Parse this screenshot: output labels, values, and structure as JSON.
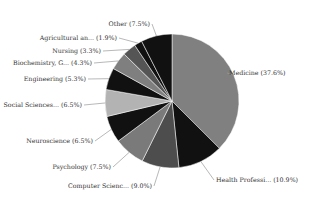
{
  "chart_data": {
    "type": "pie",
    "title": "",
    "start_angle_deg": 0,
    "direction": "clockwise",
    "legend": "none (labels on leader lines)",
    "categories": [
      "Medicine",
      "Health Professi...",
      "Computer Scienc...",
      "Psychology",
      "Neuroscience",
      "Social Sciences...",
      "Engineering",
      "Biochemistry, G...",
      "Nursing",
      "Agricultural an...",
      "Other"
    ],
    "values": [
      37.6,
      10.9,
      9.0,
      7.5,
      6.5,
      6.5,
      5.3,
      4.3,
      3.3,
      1.9,
      7.5
    ],
    "labels": [
      "Medicine (37.6%)",
      "Health Professi... (10.9%)",
      "Computer Scienc... (9.0%)",
      "Psychology (7.5%)",
      "Neuroscience (6.5%)",
      "Social Sciences... (6.5%)",
      "Engineering (5.3%)",
      "Biochemistry, G... (4.3%)",
      "Nursing (3.3%)",
      "Agricultural an... (1.9%)",
      "Other (7.5%)"
    ],
    "colors": [
      "#808080",
      "#111111",
      "#4d4d4d",
      "#7a7a7a",
      "#111111",
      "#b3b3b3",
      "#111111",
      "#7f7f7f",
      "#555555",
      "#111111",
      "#111111"
    ]
  }
}
